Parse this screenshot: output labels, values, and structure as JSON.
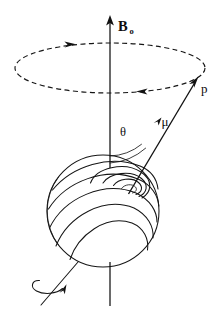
{
  "figure": {
    "background_color": "#ffffff",
    "ink_color": "#111111",
    "width": 218,
    "height": 316
  },
  "labels": {
    "field_symbol": "B",
    "field_subscript": "o",
    "field_full": "B₀",
    "momentum_symbol": "p",
    "moment_symbol": "μ",
    "angle_symbol": "θ"
  },
  "elements": {
    "field_axis_name": "B0 field axis",
    "field_arrow_name": "B0 field arrow",
    "precession_orbit_name": "dashed precession circle",
    "precession_arrow_back": "precession direction arrow (back)",
    "precession_arrow_front": "precession direction arrow (front)",
    "moment_vector_name": "magnetic moment vector mu",
    "moment_arrowhead_name": "mu vector arrowhead at p",
    "moment_midmarker_name": "mu vector mid arrow marker",
    "angle_arc_name": "theta angle arc",
    "sphere_name": "precessing nucleus sphere",
    "spin_arrow_name": "nuclear spin rotation arrow"
  },
  "geometry": {
    "axis_x": 110,
    "axis_top_y": 17,
    "axis_bottom_y": 306,
    "orbit_center_x": 110,
    "orbit_center_y": 68,
    "orbit_rx": 95,
    "orbit_ry": 25,
    "sphere_center_x": 103,
    "sphere_center_y": 211,
    "sphere_radius": 56,
    "vector_origin_x": 128,
    "vector_origin_y": 193,
    "vector_tip_x": 197,
    "vector_tip_y": 80,
    "angle_arc_radius": 52
  },
  "label_positions": {
    "field": {
      "x": 118,
      "y": 30
    },
    "field_sub": {
      "x": 129,
      "y": 33
    },
    "momentum": {
      "x": 202,
      "y": 92
    },
    "moment": {
      "x": 162,
      "y": 124
    },
    "angle": {
      "x": 122,
      "y": 135
    }
  }
}
